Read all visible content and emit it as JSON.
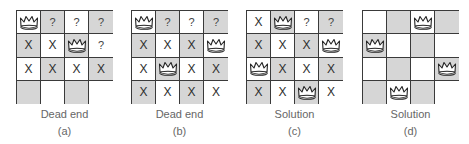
{
  "figure": {
    "symbols": {
      "queen": "crown-icon",
      "attacked": "X",
      "unknown": "?"
    },
    "colors": {
      "dark_cell": "#d6d6d6",
      "light_cell": "#ffffff",
      "grid_line": "#3a3a3a",
      "caption": "#666666"
    },
    "panels": [
      {
        "id": "a",
        "caption": "Dead end",
        "sublabel": "(a)",
        "cells": [
          [
            "Q",
            "?",
            "?",
            "?"
          ],
          [
            "X",
            "X",
            "Q",
            "?"
          ],
          [
            "X",
            "X",
            "X",
            "X"
          ],
          [
            "",
            "",
            "",
            ""
          ]
        ]
      },
      {
        "id": "b",
        "caption": "Dead end",
        "sublabel": "(b)",
        "cells": [
          [
            "Q",
            "?",
            "?",
            "?"
          ],
          [
            "X",
            "X",
            "X",
            "Q"
          ],
          [
            "X",
            "Q",
            "X",
            "X"
          ],
          [
            "X",
            "X",
            "X",
            "X"
          ]
        ]
      },
      {
        "id": "c",
        "caption": "Solution",
        "sublabel": "(c)",
        "cells": [
          [
            "X",
            "Q",
            "?",
            "?"
          ],
          [
            "X",
            "X",
            "X",
            "Q"
          ],
          [
            "Q",
            "X",
            "X",
            "X"
          ],
          [
            "X",
            "X",
            "Q",
            "X"
          ]
        ]
      },
      {
        "id": "d",
        "caption": "Solution",
        "sublabel": "(d)",
        "cells": [
          [
            "",
            "",
            "Q",
            ""
          ],
          [
            "Q",
            "",
            "",
            ""
          ],
          [
            "",
            "",
            "",
            "Q"
          ],
          [
            "",
            "Q",
            "",
            ""
          ]
        ]
      }
    ]
  }
}
